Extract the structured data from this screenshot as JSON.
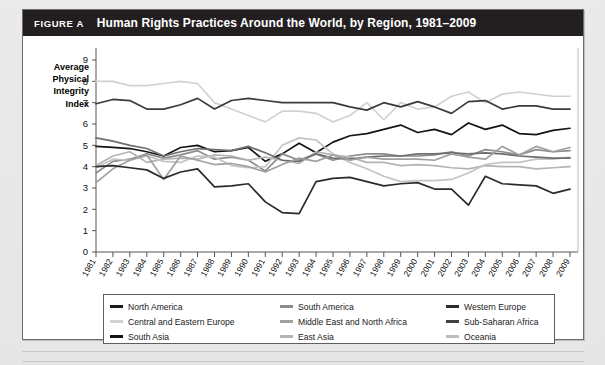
{
  "figure": {
    "label": "FIGURE A",
    "title": "Human Rights Practices Around the World, by Region, 1981–2009"
  },
  "axis": {
    "y_label_lines": [
      "Average",
      "Physical",
      "Integrity",
      "Index"
    ],
    "y_ticks": [
      "0",
      "1",
      "2",
      "3",
      "4",
      "5",
      "6",
      "7",
      "8",
      "9"
    ],
    "x_ticks": [
      "1981",
      "1982",
      "1983",
      "1984",
      "1985",
      "1986",
      "1987",
      "1988",
      "1989",
      "1990",
      "1991",
      "1992",
      "1993",
      "1994",
      "1995",
      "1996",
      "1997",
      "1998",
      "1999",
      "2000",
      "2001",
      "2002",
      "2003",
      "2004",
      "2005",
      "2006",
      "2007",
      "2008",
      "2009"
    ]
  },
  "legend": {
    "items": [
      {
        "label": "North America",
        "color": "#1a1a1a"
      },
      {
        "label": "South America",
        "color": "#8c8c8c"
      },
      {
        "label": "Western Europe",
        "color": "#2b2b2b"
      },
      {
        "label": "Central and Eastern Europe",
        "color": "#d2d2d2"
      },
      {
        "label": "Middle East and North Africa",
        "color": "#a0a0a0"
      },
      {
        "label": "Sub-Saharan Africa",
        "color": "#404040"
      },
      {
        "label": "South Asia",
        "color": "#141414"
      },
      {
        "label": "East Asia",
        "color": "#b4b4b4"
      },
      {
        "label": "Oceania",
        "color": "#bdbdbd"
      }
    ]
  },
  "chart_data": {
    "type": "line",
    "title": "Human Rights Practices Around the World, by Region, 1981–2009",
    "xlabel": "",
    "ylabel": "Average Physical Integrity Index",
    "ylim": [
      0,
      9
    ],
    "grid": false,
    "legend_position": "bottom",
    "x": [
      1981,
      1982,
      1983,
      1984,
      1985,
      1986,
      1987,
      1988,
      1989,
      1990,
      1991,
      1992,
      1993,
      1994,
      1995,
      1996,
      1997,
      1998,
      1999,
      2000,
      2001,
      2002,
      2003,
      2004,
      2005,
      2006,
      2007,
      2008,
      2009
    ],
    "series": [
      {
        "name": "Western Europe",
        "color": "#d2d2d2",
        "values": [
          8.0,
          8.0,
          7.8,
          7.8,
          7.9,
          8.0,
          7.9,
          7.0,
          6.7,
          6.4,
          6.1,
          6.6,
          6.6,
          6.5,
          6.1,
          6.4,
          7.0,
          6.2,
          7.0,
          6.7,
          6.8,
          7.3,
          7.5,
          7.0,
          7.4,
          7.5,
          7.4,
          7.3,
          7.3
        ]
      },
      {
        "name": "North America",
        "color": "#3a3a3a",
        "values": [
          6.95,
          7.15,
          7.1,
          6.7,
          6.7,
          6.9,
          7.2,
          6.7,
          7.1,
          7.2,
          7.1,
          7.0,
          7.0,
          7.0,
          7.0,
          6.8,
          6.65,
          7.0,
          6.8,
          7.05,
          6.8,
          6.5,
          7.05,
          7.1,
          6.7,
          6.85,
          6.85,
          6.7,
          6.7
        ]
      },
      {
        "name": "Sub-Saharan Africa",
        "color": "#6e6e6e",
        "values": [
          5.35,
          5.2,
          5.0,
          4.85,
          4.5,
          4.7,
          4.85,
          4.8,
          4.75,
          4.95,
          4.65,
          4.3,
          4.25,
          4.6,
          4.4,
          4.35,
          4.45,
          4.5,
          4.5,
          4.6,
          4.6,
          4.65,
          4.6,
          4.65,
          4.6,
          4.5,
          4.45,
          4.4,
          4.4
        ]
      },
      {
        "name": "South Asia",
        "color": "#141414",
        "values": [
          4.95,
          4.9,
          4.85,
          4.7,
          4.5,
          4.9,
          5.0,
          4.7,
          4.75,
          4.9,
          4.25,
          4.6,
          5.1,
          4.65,
          5.15,
          5.45,
          5.55,
          5.75,
          5.95,
          5.6,
          5.75,
          5.5,
          6.05,
          5.75,
          5.95,
          5.55,
          5.5,
          5.7,
          5.8
        ]
      },
      {
        "name": "South America",
        "color": "#8c8c8c",
        "values": [
          3.7,
          4.25,
          4.35,
          4.6,
          4.4,
          4.55,
          4.75,
          4.35,
          4.45,
          4.3,
          3.8,
          4.6,
          4.3,
          4.6,
          4.3,
          4.5,
          4.6,
          4.6,
          4.5,
          4.5,
          4.55,
          4.7,
          4.5,
          4.8,
          4.7,
          4.55,
          4.8,
          4.7,
          4.75
        ]
      },
      {
        "name": "Middle East and North Africa",
        "color": "#a0a0a0",
        "values": [
          3.25,
          3.9,
          4.3,
          4.55,
          3.4,
          4.5,
          4.3,
          4.1,
          4.15,
          4.0,
          3.75,
          4.1,
          4.4,
          4.25,
          4.55,
          4.3,
          4.45,
          4.35,
          4.35,
          4.35,
          4.3,
          4.6,
          4.45,
          4.35,
          4.95,
          4.55,
          4.95,
          4.7,
          4.9
        ]
      },
      {
        "name": "East Asia",
        "color": "#b4b4b4",
        "values": [
          4.05,
          4.5,
          4.7,
          4.2,
          4.35,
          4.4,
          4.35,
          4.55,
          4.5,
          4.3,
          4.45,
          4.3,
          4.15,
          4.7,
          4.55,
          4.45,
          4.2,
          4.2,
          4.05,
          4.1,
          4.05,
          3.95,
          3.9,
          4.05,
          4.0,
          4.0,
          3.9,
          3.95,
          4.0
        ]
      },
      {
        "name": "Oceania",
        "color": "#c4c4c4",
        "values": [
          3.95,
          4.35,
          4.3,
          4.5,
          4.25,
          4.2,
          4.5,
          4.45,
          4.05,
          3.95,
          4.0,
          5.0,
          5.35,
          5.25,
          4.6,
          4.2,
          3.9,
          3.55,
          3.3,
          3.35,
          3.35,
          3.4,
          3.7,
          4.1,
          4.2,
          4.2,
          4.35,
          4.35,
          4.45
        ]
      },
      {
        "name": "Central and Eastern Europe",
        "color": "#2b2b2b",
        "values": [
          4.0,
          4.05,
          3.95,
          3.85,
          3.45,
          3.75,
          3.9,
          3.05,
          3.1,
          3.2,
          2.35,
          1.85,
          1.8,
          3.3,
          3.45,
          3.5,
          3.3,
          3.1,
          3.2,
          3.25,
          2.95,
          2.95,
          2.2,
          3.55,
          3.2,
          3.15,
          3.1,
          2.75,
          2.95
        ]
      }
    ]
  }
}
